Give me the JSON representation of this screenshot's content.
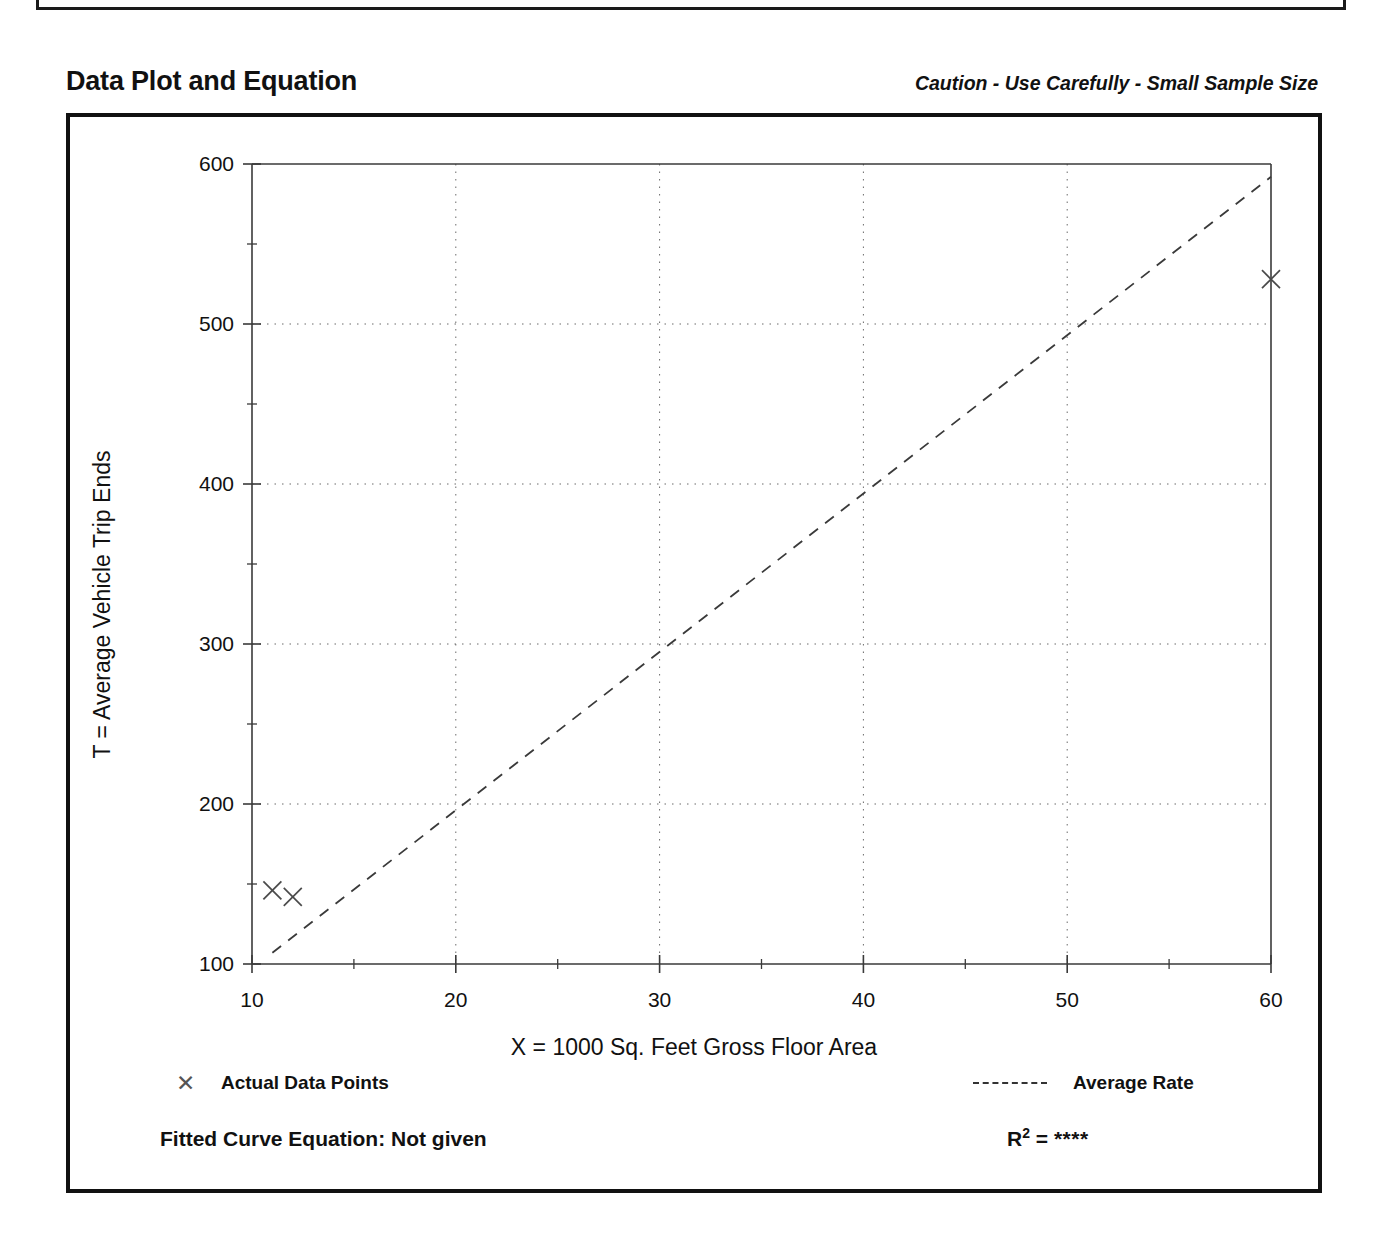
{
  "page": {
    "title": "Data Plot and Equation",
    "caution": "Caution - Use Carefully - Small Sample Size"
  },
  "footer": {
    "fitted_equation": "Fitted Curve Equation:  Not given",
    "r_squared_symbol": "R",
    "r_squared_exponent": "2",
    "r_squared_equals": " = ",
    "r_squared_value": "****"
  },
  "legend": {
    "points_label": "Actual Data Points",
    "points_marker": "x-marker-icon",
    "line_label": "Average Rate",
    "line_marker": "dashed-line-icon"
  },
  "chart_data": {
    "type": "scatter",
    "title": "Data Plot and Equation",
    "subtitle": "Caution - Use Carefully - Small Sample Size",
    "xlabel": "X = 1000 Sq. Feet Gross Floor Area",
    "ylabel": "T = Average Vehicle Trip Ends",
    "xlim": [
      10,
      60
    ],
    "ylim": [
      100,
      600
    ],
    "xticks": [
      10,
      20,
      30,
      40,
      50,
      60
    ],
    "xtick_labels": [
      "10",
      "20",
      "30",
      "40",
      "50",
      "60"
    ],
    "yticks": [
      100,
      200,
      300,
      400,
      500,
      600
    ],
    "ytick_labels": [
      "100",
      "200",
      "300",
      "400",
      "500",
      "600"
    ],
    "x_minor_ticks": [
      15,
      25,
      35,
      45,
      55
    ],
    "y_minor_ticks": [
      150,
      250,
      350,
      450,
      550
    ],
    "grid": true,
    "grid_style": "dotted",
    "legend_position": "below-axes",
    "series": [
      {
        "name": "Actual Data Points",
        "type": "scatter",
        "marker": "x",
        "points": [
          {
            "x": 11.0,
            "y": 146
          },
          {
            "x": 12.0,
            "y": 142
          },
          {
            "x": 60.0,
            "y": 528
          }
        ]
      },
      {
        "name": "Average Rate",
        "type": "line",
        "style": "dashed",
        "points": [
          {
            "x": 11.0,
            "y": 107
          },
          {
            "x": 60.0,
            "y": 592
          }
        ]
      }
    ]
  }
}
